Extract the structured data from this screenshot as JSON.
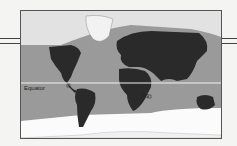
{
  "map": {
    "type": "world map",
    "equator_label": "Equator",
    "marker_label": "FG",
    "colors": {
      "land_dark": "#2a2a2a",
      "band": "#9a9a9a",
      "polar": "#e6e6e6",
      "south": "#fbfbfb",
      "equator_line": "#f2f2f2"
    }
  }
}
